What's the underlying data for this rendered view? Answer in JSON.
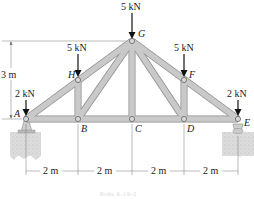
{
  "diagram": {
    "type": "roof truss",
    "nodes": {
      "A": {
        "label": "A",
        "x": 26,
        "y": 119
      },
      "B": {
        "label": "B",
        "x": 78,
        "y": 119
      },
      "C": {
        "label": "C",
        "x": 132,
        "y": 119
      },
      "D": {
        "label": "D",
        "x": 184,
        "y": 119
      },
      "E": {
        "label": "E",
        "x": 238,
        "y": 119
      },
      "F": {
        "label": "F",
        "x": 184,
        "y": 80
      },
      "G": {
        "label": "G",
        "x": 132,
        "y": 41
      },
      "H": {
        "label": "H",
        "x": 78,
        "y": 80
      }
    },
    "members": [
      [
        "A",
        "B"
      ],
      [
        "B",
        "C"
      ],
      [
        "C",
        "D"
      ],
      [
        "D",
        "E"
      ],
      [
        "A",
        "H"
      ],
      [
        "H",
        "G"
      ],
      [
        "G",
        "F"
      ],
      [
        "F",
        "E"
      ],
      [
        "H",
        "B"
      ],
      [
        "B",
        "G"
      ],
      [
        "G",
        "C"
      ],
      [
        "G",
        "D"
      ],
      [
        "D",
        "F"
      ]
    ],
    "loads": [
      {
        "node": "A",
        "label": "2 kN"
      },
      {
        "node": "H",
        "label": "5 kN"
      },
      {
        "node": "G",
        "label": "5 kN"
      },
      {
        "node": "F",
        "label": "5 kN"
      },
      {
        "node": "E",
        "label": "2 kN"
      }
    ],
    "supports": [
      {
        "node": "A",
        "type": "pin"
      },
      {
        "node": "E",
        "type": "roller"
      }
    ],
    "dimensions": {
      "height": "3 m",
      "spans": [
        "2 m",
        "2 m",
        "2 m",
        "2 m"
      ]
    },
    "caption": "Probs. 6–1/6–2",
    "colors": {
      "member_fill": "#c9c9c9",
      "member_edge": "#8a8a8a",
      "support_fill": "#e0e0e0",
      "arrow": "#111111"
    }
  }
}
